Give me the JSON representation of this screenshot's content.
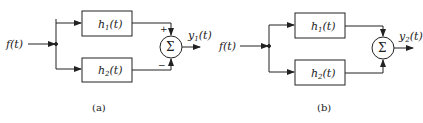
{
  "diagrams": [
    {
      "id": "a",
      "caption": "(a)",
      "input": "f(t)",
      "block_top": {
        "name": "h",
        "sub": "1",
        "arg": "(t)"
      },
      "block_bottom": {
        "name": "h",
        "sub": "2",
        "arg": "(t)"
      },
      "summer_symbol": "Σ",
      "sign_top": "+",
      "sign_bottom": "−",
      "output": {
        "name": "y",
        "sub": "1",
        "arg": "(t)"
      }
    },
    {
      "id": "b",
      "caption": "(b)",
      "input": "f(t)",
      "block_top": {
        "name": "h",
        "sub": "1",
        "arg": "(t)"
      },
      "block_bottom": {
        "name": "h",
        "sub": "2",
        "arg": "(t)"
      },
      "summer_symbol": "Σ",
      "output": {
        "name": "y",
        "sub": "2",
        "arg": "(t)"
      }
    }
  ]
}
